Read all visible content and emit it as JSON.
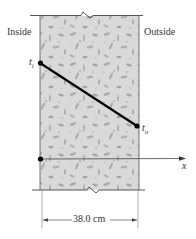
{
  "labels": {
    "inside": "Inside",
    "outside": "Outside",
    "t_inner": "t",
    "t_inner_sub": "i",
    "t_outer": "t",
    "t_outer_sub": "o",
    "x_axis": "x",
    "dimension": "38.0 cm"
  },
  "wall": {
    "material": "concrete",
    "thickness": "38.0 cm",
    "fill_color": "#d9d9d9",
    "fleck_color": "#a9a9a9"
  },
  "temperature_profile": {
    "type": "linear",
    "from": "t_i",
    "to": "t_o",
    "line_color": "#000000"
  }
}
